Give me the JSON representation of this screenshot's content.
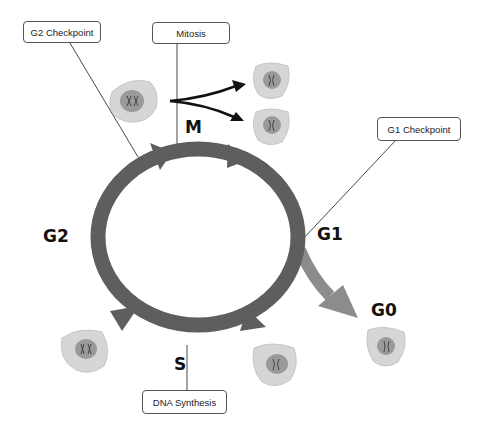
{
  "diagram": {
    "colors": {
      "ring": "#5e5e5e",
      "g0_arrow": "#8c8c8c",
      "cell_fill": "#d6d6d6",
      "nucleus": "#9a9a9a",
      "label_border": "#555555"
    },
    "callouts": {
      "g2_checkpoint": "G2 Checkpoint",
      "mitosis": "Mitosis",
      "g1_checkpoint": "G1 Checkpoint",
      "dna_synthesis": "DNA Synthesis"
    },
    "phases": {
      "m": "M",
      "g1": "G1",
      "g2": "G2",
      "s": "S",
      "g0": "G0"
    },
    "nodes": [
      {
        "id": "mitosis",
        "label": "Mitosis",
        "phase": "M"
      },
      {
        "id": "g1",
        "label": "G1 Checkpoint",
        "phase": "G1"
      },
      {
        "id": "s",
        "label": "DNA Synthesis",
        "phase": "S"
      },
      {
        "id": "g2",
        "label": "G2 Checkpoint",
        "phase": "G2"
      },
      {
        "id": "g0",
        "label": "G0",
        "phase": "G0"
      }
    ],
    "edges": [
      {
        "from": "M",
        "to": "G1"
      },
      {
        "from": "G1",
        "to": "S"
      },
      {
        "from": "S",
        "to": "G2"
      },
      {
        "from": "G2",
        "to": "M"
      },
      {
        "from": "G1",
        "to": "G0"
      },
      {
        "from": "M",
        "to": "two daughter cells"
      }
    ]
  }
}
